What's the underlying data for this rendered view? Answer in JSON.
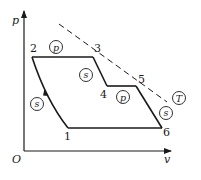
{
  "diagram": {
    "type": "p-v thermodynamic cycle diagram",
    "axes": {
      "y_label": "p",
      "x_label": "v",
      "origin_label": "O"
    },
    "points": [
      {
        "id": "1",
        "label": "1",
        "x": 68,
        "y": 128,
        "lx": 64,
        "ly": 140
      },
      {
        "id": "2",
        "label": "2",
        "x": 32,
        "y": 57,
        "lx": 30,
        "ly": 52
      },
      {
        "id": "3",
        "label": "3",
        "x": 93,
        "y": 57,
        "lx": 94,
        "ly": 52
      },
      {
        "id": "4",
        "label": "4",
        "x": 107,
        "y": 86,
        "lx": 100,
        "ly": 98
      },
      {
        "id": "5",
        "label": "5",
        "x": 136,
        "y": 86,
        "lx": 138,
        "ly": 82
      },
      {
        "id": "6",
        "label": "6",
        "x": 162,
        "y": 128,
        "lx": 163,
        "ly": 136
      }
    ],
    "processes": [
      {
        "from": "1",
        "to": "2",
        "type": "s",
        "meaning": "isentropic compression"
      },
      {
        "from": "2",
        "to": "3",
        "type": "p",
        "meaning": "isobaric heat addition"
      },
      {
        "from": "3",
        "to": "4",
        "type": "s",
        "meaning": "isentropic expansion"
      },
      {
        "from": "4",
        "to": "5",
        "type": "p",
        "meaning": "isobaric reheat"
      },
      {
        "from": "5",
        "to": "6",
        "type": "s",
        "meaning": "isentropic expansion"
      },
      {
        "from": "6",
        "to": "1",
        "type": "p",
        "meaning": "isobaric heat rejection"
      }
    ],
    "circled_labels": [
      {
        "text": "p",
        "x": 56,
        "y": 47,
        "near": "2-3"
      },
      {
        "text": "s",
        "x": 86,
        "y": 75,
        "near": "3-4"
      },
      {
        "text": "p",
        "x": 123,
        "y": 97,
        "near": "4-5"
      },
      {
        "text": "s",
        "x": 166,
        "y": 113,
        "near": "5-6"
      },
      {
        "text": "s",
        "x": 37,
        "y": 104,
        "near": "1-2"
      },
      {
        "text": "T",
        "x": 179,
        "y": 98,
        "near": "isotherm"
      }
    ],
    "isotherm": {
      "label": "T",
      "style": "dashed",
      "from": {
        "x": 59,
        "y": 24
      },
      "to": {
        "x": 167,
        "y": 102
      }
    },
    "colors": {
      "line": "#1a1a1a",
      "background": "#ffffff"
    }
  }
}
